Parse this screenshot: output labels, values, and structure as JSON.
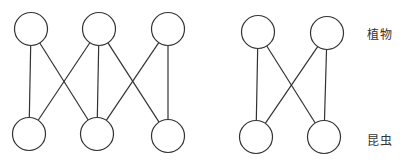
{
  "labels": {
    "top": "植物",
    "bottom": "昆虫"
  },
  "style": {
    "stroke": "#333333",
    "fill": "#ffffff"
  },
  "networks": [
    {
      "name": "left-network",
      "plants": [
        {
          "id": "P1",
          "x": 31,
          "y": 29
        },
        {
          "id": "P2",
          "x": 99,
          "y": 29
        },
        {
          "id": "P3",
          "x": 168,
          "y": 29
        }
      ],
      "insects": [
        {
          "id": "I1",
          "x": 29,
          "y": 134
        },
        {
          "id": "I2",
          "x": 97,
          "y": 134
        },
        {
          "id": "I3",
          "x": 168,
          "y": 136
        }
      ],
      "edges": [
        [
          "P1",
          "I1"
        ],
        [
          "P1",
          "I2"
        ],
        [
          "P2",
          "I1"
        ],
        [
          "P2",
          "I2"
        ],
        [
          "P2",
          "I3"
        ],
        [
          "P3",
          "I2"
        ],
        [
          "P3",
          "I3"
        ]
      ]
    },
    {
      "name": "right-network",
      "plants": [
        {
          "id": "P1",
          "x": 258,
          "y": 32
        },
        {
          "id": "P2",
          "x": 327,
          "y": 33
        }
      ],
      "insects": [
        {
          "id": "I1",
          "x": 256,
          "y": 137
        },
        {
          "id": "I2",
          "x": 324,
          "y": 137
        }
      ],
      "edges": [
        [
          "P1",
          "I1"
        ],
        [
          "P1",
          "I2"
        ],
        [
          "P2",
          "I1"
        ],
        [
          "P2",
          "I2"
        ]
      ]
    }
  ],
  "node_radius": 16.5
}
